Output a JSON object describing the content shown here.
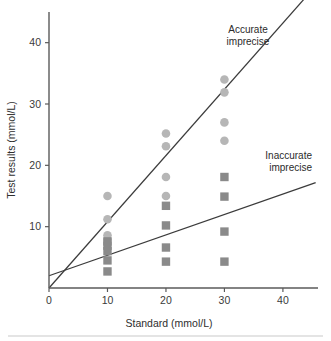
{
  "figure": {
    "background_color": "#ffffff",
    "footer_rule_color": "#c9c9c9"
  },
  "axes": {
    "x": {
      "title": "Standard (mmol/L)",
      "ticks": [
        0,
        10,
        20,
        30,
        40
      ],
      "tick_labels": [
        "0",
        "10",
        "20",
        "30",
        "40"
      ],
      "range": [
        0,
        46
      ]
    },
    "y": {
      "title": "Test results (mmol/L)",
      "ticks": [
        10,
        20,
        30,
        40
      ],
      "tick_labels": [
        "10",
        "20",
        "30",
        "40"
      ],
      "range": [
        0,
        45
      ]
    },
    "axis_color": "#5a5a5a"
  },
  "annotations": [
    {
      "name": "accurate-imprecise-label",
      "line1": "Accurate",
      "line2": "imprecise",
      "x_px": 248,
      "y_px": 33
    },
    {
      "name": "inaccurate-imprecise-label",
      "line1": "Inaccurate",
      "line2": "imprecise",
      "x_px": 312,
      "y_px": 159
    }
  ],
  "chart_data": {
    "type": "scatter",
    "title": "",
    "subtitle": "",
    "xlabel": "Standard (mmol/L)",
    "ylabel": "Test results (mmol/L)",
    "xlim": [
      0,
      46
    ],
    "ylim": [
      0,
      45
    ],
    "xticks": [
      0,
      10,
      20,
      30,
      40
    ],
    "yticks": [
      10,
      20,
      30,
      40
    ],
    "grid": false,
    "legend_position": "none",
    "annotations": [
      "Accurate imprecise",
      "Inaccurate imprecise"
    ],
    "series": [
      {
        "name": "Accurate imprecise",
        "marker": "circle",
        "color": "#b6b6b6",
        "points": [
          {
            "x": 10,
            "y": 15.0
          },
          {
            "x": 10,
            "y": 11.2
          },
          {
            "x": 10,
            "y": 8.6
          },
          {
            "x": 10,
            "y": 7.9
          },
          {
            "x": 20,
            "y": 25.2
          },
          {
            "x": 20,
            "y": 23.1
          },
          {
            "x": 20,
            "y": 18.1
          },
          {
            "x": 20,
            "y": 15.0
          },
          {
            "x": 30,
            "y": 34.0
          },
          {
            "x": 30,
            "y": 31.9
          },
          {
            "x": 30,
            "y": 27.0
          },
          {
            "x": 30,
            "y": 24.0
          }
        ]
      },
      {
        "name": "Inaccurate imprecise",
        "marker": "square",
        "color": "#8a8a8a",
        "points": [
          {
            "x": 10,
            "y": 7.6
          },
          {
            "x": 10,
            "y": 6.9
          },
          {
            "x": 10,
            "y": 6.0
          },
          {
            "x": 10,
            "y": 4.5
          },
          {
            "x": 10,
            "y": 2.7
          },
          {
            "x": 20,
            "y": 13.4
          },
          {
            "x": 20,
            "y": 10.2
          },
          {
            "x": 20,
            "y": 6.6
          },
          {
            "x": 20,
            "y": 4.3
          },
          {
            "x": 30,
            "y": 18.1
          },
          {
            "x": 30,
            "y": 14.9
          },
          {
            "x": 30,
            "y": 9.2
          },
          {
            "x": 30,
            "y": 4.3
          }
        ]
      }
    ],
    "trend_lines": [
      {
        "name": "accurate-imprecise-line",
        "label": "Accurate imprecise",
        "intercept": 0.0,
        "slope": 1.08,
        "x_start": 0,
        "x_end": 45.6,
        "color": "#3b3b3b"
      },
      {
        "name": "inaccurate-imprecise-line",
        "label": "Inaccurate imprecise",
        "intercept": 2.0,
        "slope": 0.333,
        "x_start": 0,
        "x_end": 45.6,
        "color": "#3b3b3b"
      }
    ]
  }
}
